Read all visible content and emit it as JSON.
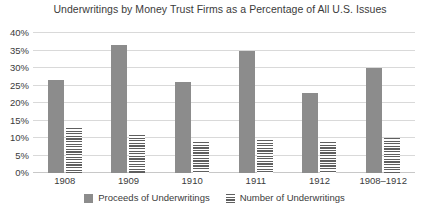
{
  "chart_data": {
    "type": "bar",
    "title": "Underwritings by Money Trust Firms as a Percentage of All U.S. Issues",
    "xlabel": "",
    "ylabel": "",
    "ylim": [
      0,
      40
    ],
    "ytick_labels": [
      "40%",
      "35%",
      "30%",
      "25%",
      "20%",
      "15%",
      "10%",
      "5%",
      "0%"
    ],
    "ytick_values": [
      40,
      35,
      30,
      25,
      20,
      15,
      10,
      5,
      0
    ],
    "grid": true,
    "legend_position": "bottom",
    "categories": [
      "1908",
      "1909",
      "1910",
      "1911",
      "1912",
      "1908–1912"
    ],
    "series": [
      {
        "name": "Proceeds of Underwritings",
        "color": "#8c8c8c",
        "pattern": "solid",
        "values": [
          26.5,
          36.5,
          26,
          35,
          23,
          30
        ]
      },
      {
        "name": "Number of Underwritings",
        "color": "#5f5f5f",
        "pattern": "horizontal-lines",
        "values": [
          13,
          11,
          9,
          9.5,
          9,
          10
        ]
      }
    ]
  }
}
